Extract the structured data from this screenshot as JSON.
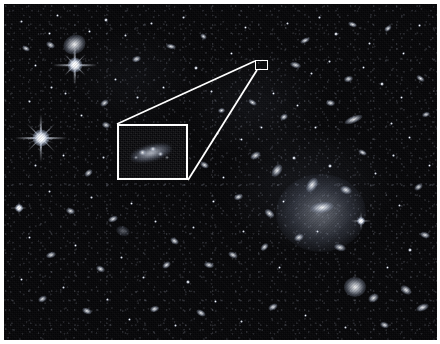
{
  "figure": {
    "type": "astronomical-deep-field-image",
    "title": "",
    "caption": "",
    "background_color": "#060608",
    "annotation_color": "#ffffff",
    "frame": {
      "x": 4,
      "y": 4,
      "width": 433,
      "height": 336
    }
  },
  "annotations": {
    "source_box": {
      "label": "",
      "x": 255,
      "y": 60,
      "width": 13,
      "height": 10,
      "description": "small white rectangle marking the high-redshift galaxy candidate"
    },
    "inset_box": {
      "label": "",
      "x": 117,
      "y": 124,
      "width": 71,
      "height": 56,
      "description": "enlarged inset showing the faint diffuse galaxy"
    },
    "connector_lines": [
      {
        "name": "upper-connector",
        "x1": 117,
        "y1": 124,
        "x2": 255,
        "y2": 61
      },
      {
        "name": "lower-connector",
        "x1": 188,
        "y1": 180,
        "x2": 257,
        "y2": 70
      }
    ]
  },
  "sky_objects": {
    "bright_stars": [
      {
        "name": "star-upper-left",
        "x": 71,
        "y": 61,
        "size": 46,
        "brightness": 1.0
      },
      {
        "name": "star-left-edge",
        "x": 36,
        "y": 133,
        "size": 52,
        "brightness": 1.0
      },
      {
        "name": "star-center-right",
        "x": 356,
        "y": 216,
        "size": 20,
        "brightness": 0.7
      },
      {
        "name": "star-lower-left",
        "x": 14,
        "y": 203,
        "size": 16,
        "brightness": 0.6
      }
    ],
    "notable_galaxies": [
      {
        "name": "spiral-galaxy-upper-left",
        "x": 70,
        "y": 40,
        "width": 22,
        "height": 18
      },
      {
        "name": "elliptical-cluster-member",
        "x": 350,
        "y": 283,
        "width": 20,
        "height": 18
      },
      {
        "name": "edge-on-spiral",
        "x": 348,
        "y": 115,
        "width": 18,
        "height": 7
      },
      {
        "name": "lenticular-galaxy",
        "x": 316,
        "y": 203,
        "width": 22,
        "height": 10
      },
      {
        "name": "cluster-core",
        "x": 300,
        "y": 215,
        "width": 60,
        "height": 50
      }
    ],
    "counts": {
      "resolved_sources": 180
    }
  }
}
